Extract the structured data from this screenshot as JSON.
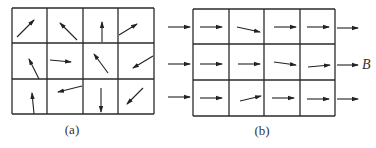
{
  "figure": {
    "panel_a": {
      "label": "(a)",
      "grid": {
        "rows": 3,
        "cols": 4,
        "x0": 12,
        "y0": 8,
        "x1": 154,
        "y1": 114,
        "col_lines": [
          12,
          47,
          83,
          118,
          154
        ],
        "row_lines": [
          8,
          43,
          79,
          114
        ]
      },
      "arrows": [
        {
          "cell": "r1c1",
          "from": [
            17,
            37
          ],
          "to": [
            34,
            20
          ]
        },
        {
          "cell": "r1c2",
          "from": [
            77,
            40
          ],
          "to": [
            60,
            23
          ]
        },
        {
          "cell": "r1c3",
          "from": [
            102,
            42
          ],
          "to": [
            102,
            22
          ]
        },
        {
          "cell": "r1c4",
          "from": [
            119,
            35
          ],
          "to": [
            137,
            24
          ]
        },
        {
          "cell": "r2c1",
          "from": [
            39,
            79
          ],
          "to": [
            29,
            59
          ]
        },
        {
          "cell": "r2c2",
          "from": [
            50,
            60
          ],
          "to": [
            71,
            62
          ]
        },
        {
          "cell": "r2c3",
          "from": [
            108,
            73
          ],
          "to": [
            94,
            54
          ]
        },
        {
          "cell": "r2c4",
          "from": [
            153,
            56
          ],
          "to": [
            133,
            68
          ]
        },
        {
          "cell": "r3c1",
          "from": [
            34,
            114
          ],
          "to": [
            32,
            93
          ]
        },
        {
          "cell": "r3c2",
          "from": [
            82,
            86
          ],
          "to": [
            58,
            92
          ]
        },
        {
          "cell": "r3c3",
          "from": [
            101,
            88
          ],
          "to": [
            101,
            112
          ]
        },
        {
          "cell": "r3c4",
          "from": [
            143,
            88
          ],
          "to": [
            127,
            104
          ]
        }
      ],
      "label_pos": [
        72,
        134
      ]
    },
    "panel_b": {
      "label": "(b)",
      "field_label": "B",
      "field_label_pos": [
        362,
        69
      ],
      "grid": {
        "rows": 3,
        "cols": 4,
        "x0": 193,
        "y0": 9,
        "x1": 335,
        "y1": 116,
        "col_lines": [
          193,
          229,
          264,
          300,
          335
        ],
        "row_lines": [
          9,
          44,
          80,
          116
        ]
      },
      "arrows": [
        {
          "cell": "r1-in",
          "from": [
            168,
            27
          ],
          "to": [
            190,
            27
          ]
        },
        {
          "cell": "r1c1",
          "from": [
            200,
            27
          ],
          "to": [
            222,
            27
          ]
        },
        {
          "cell": "r1c2",
          "from": [
            237,
            27
          ],
          "to": [
            260,
            32
          ]
        },
        {
          "cell": "r1c3",
          "from": [
            274,
            27
          ],
          "to": [
            296,
            27
          ]
        },
        {
          "cell": "r1c4",
          "from": [
            307,
            27
          ],
          "to": [
            329,
            27
          ]
        },
        {
          "cell": "r1-out",
          "from": [
            337,
            28
          ],
          "to": [
            358,
            28
          ]
        },
        {
          "cell": "r2-in",
          "from": [
            168,
            64
          ],
          "to": [
            190,
            64
          ]
        },
        {
          "cell": "r2c1",
          "from": [
            200,
            64
          ],
          "to": [
            222,
            64
          ]
        },
        {
          "cell": "r2c2",
          "from": [
            238,
            64
          ],
          "to": [
            260,
            64
          ]
        },
        {
          "cell": "r2c3",
          "from": [
            274,
            62
          ],
          "to": [
            296,
            65
          ]
        },
        {
          "cell": "r2c4",
          "from": [
            308,
            67
          ],
          "to": [
            330,
            65
          ]
        },
        {
          "cell": "r2-out",
          "from": [
            337,
            65
          ],
          "to": [
            358,
            65
          ]
        },
        {
          "cell": "r3-in",
          "from": [
            168,
            97
          ],
          "to": [
            190,
            97
          ]
        },
        {
          "cell": "r3c1",
          "from": [
            200,
            98
          ],
          "to": [
            222,
            98
          ]
        },
        {
          "cell": "r3c2",
          "from": [
            240,
            101
          ],
          "to": [
            261,
            96
          ]
        },
        {
          "cell": "r3c3",
          "from": [
            272,
            98
          ],
          "to": [
            294,
            98
          ]
        },
        {
          "cell": "r3c4",
          "from": [
            307,
            99
          ],
          "to": [
            329,
            99
          ]
        },
        {
          "cell": "r3-out",
          "from": [
            337,
            99
          ],
          "to": [
            358,
            99
          ]
        }
      ],
      "label_pos": [
        262,
        135
      ]
    },
    "colors": {
      "line": "#2a2a2a",
      "arrow": "#222222",
      "text": "#333333",
      "background": "#ffffff"
    }
  }
}
